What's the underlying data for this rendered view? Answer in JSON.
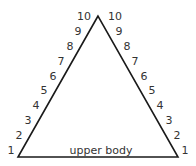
{
  "diagram": {
    "type": "triangle-scale",
    "base_label": "upper body",
    "stroke_color": "#1a1a1a",
    "text_color": "#333333",
    "vertices": {
      "apex": [
        98,
        16
      ],
      "bottom_left": [
        18,
        157
      ],
      "bottom_right": [
        178,
        157
      ]
    },
    "left_scale": {
      "labels": [
        "1",
        "2",
        "3",
        "4",
        "5",
        "6",
        "7",
        "8",
        "9",
        "10"
      ],
      "positions": [
        [
          11,
          150
        ],
        [
          19,
          135
        ],
        [
          28,
          120
        ],
        [
          36,
          105
        ],
        [
          44,
          90
        ],
        [
          53,
          76
        ],
        [
          61,
          61
        ],
        [
          70,
          46
        ],
        [
          78,
          31
        ],
        [
          84,
          16
        ]
      ]
    },
    "right_scale": {
      "labels": [
        "1",
        "2",
        "3",
        "4",
        "5",
        "6",
        "7",
        "8",
        "9",
        "10"
      ],
      "positions": [
        [
          185,
          150
        ],
        [
          177,
          135
        ],
        [
          169,
          120
        ],
        [
          160,
          105
        ],
        [
          152,
          90
        ],
        [
          144,
          76
        ],
        [
          135,
          61
        ],
        [
          127,
          46
        ],
        [
          119,
          31
        ],
        [
          115,
          16
        ]
      ]
    }
  }
}
